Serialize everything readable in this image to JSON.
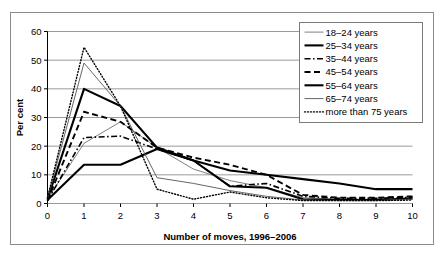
{
  "chart_data": {
    "type": "line",
    "title": "",
    "xlabel": "Number of moves, 1996–2006",
    "ylabel": "Per cent",
    "x": [
      0,
      1,
      2,
      3,
      4,
      5,
      6,
      7,
      8,
      9,
      10
    ],
    "xlim": [
      0,
      10
    ],
    "ylim": [
      0,
      60
    ],
    "xticks": [
      "0",
      "1",
      "2",
      "3",
      "4",
      "5",
      "6",
      "7",
      "8",
      "9",
      "10"
    ],
    "yticks": [
      "0",
      "10",
      "20",
      "30",
      "40",
      "50",
      "60"
    ],
    "grid": "horizontal",
    "legend_position": "top-right",
    "series": [
      {
        "name": "18–24 years",
        "style": "solid-thin",
        "color": "#808080",
        "width": 1,
        "dash": "none",
        "values": [
          1.5,
          21.0,
          28.5,
          19.5,
          12.0,
          8.0,
          5.5,
          2.0,
          1.5,
          1.5,
          1.5
        ]
      },
      {
        "name": "25–34 years",
        "style": "solid-thick",
        "color": "#000000",
        "width": 2.1,
        "dash": "none",
        "values": [
          1.5,
          40.0,
          34.0,
          19.5,
          15.0,
          11.5,
          10.0,
          8.5,
          7.0,
          5.0,
          5.0
        ]
      },
      {
        "name": "35–44 years",
        "style": "dash-dot",
        "color": "#000000",
        "width": 1.6,
        "dash": "6,2.5,1.5,2.5",
        "values": [
          1.0,
          23.0,
          23.5,
          19.0,
          15.0,
          6.0,
          7.0,
          2.5,
          1.8,
          1.8,
          2.2
        ]
      },
      {
        "name": "45–54 years",
        "style": "dashed",
        "color": "#000000",
        "width": 1.9,
        "dash": "6,3.5",
        "values": [
          1.0,
          32.0,
          28.5,
          19.5,
          16.0,
          13.5,
          10.0,
          3.0,
          2.0,
          2.0,
          2.5
        ]
      },
      {
        "name": "55–64 years",
        "style": "solid-thick",
        "color": "#000000",
        "width": 2.1,
        "dash": "none",
        "values": [
          1.2,
          13.5,
          13.5,
          19.0,
          15.0,
          6.0,
          5.5,
          1.5,
          1.2,
          1.2,
          1.8
        ]
      },
      {
        "name": "65–74 years",
        "style": "solid-thin",
        "color": "#666666",
        "width": 1,
        "dash": "none",
        "values": [
          1.8,
          49.0,
          34.0,
          9.0,
          7.0,
          4.5,
          2.5,
          1.2,
          1.0,
          1.0,
          1.5
        ]
      },
      {
        "name": "more than 75 years",
        "style": "dotted",
        "color": "#000000",
        "width": 1.4,
        "dash": "1,2",
        "values": [
          2.0,
          54.5,
          34.0,
          5.0,
          1.5,
          4.0,
          2.0,
          1.0,
          1.0,
          1.0,
          1.2
        ]
      }
    ]
  },
  "legend": {
    "entries": [
      {
        "label": "18–24 years"
      },
      {
        "label": "25–34 years"
      },
      {
        "label": "35–44 years"
      },
      {
        "label": "45–54 years"
      },
      {
        "label": "55–64 years"
      },
      {
        "label": "65–74 years"
      },
      {
        "label": "more than 75 years"
      }
    ]
  },
  "colors": {
    "axis": "#000000",
    "grid": "#9a9a9a",
    "border": "#8a8a8a",
    "background": "#ffffff"
  }
}
